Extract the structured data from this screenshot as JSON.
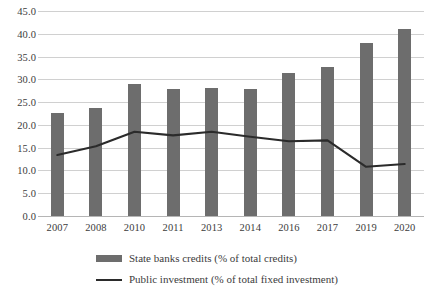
{
  "chart_data": {
    "type": "bar",
    "title": "",
    "subtitle": "",
    "xlabel": "",
    "ylabel": "",
    "categories": [
      "2007",
      "2008",
      "2010",
      "2011",
      "2013",
      "2014",
      "2016",
      "2017",
      "2019",
      "2020"
    ],
    "ylim": [
      0.0,
      45.0
    ],
    "ytick_step": 5.0,
    "ytick_labels": [
      "45.0",
      "40.0",
      "35.0",
      "30.0",
      "25.0",
      "20.0",
      "15.0",
      "10.0",
      "5.0",
      "0.0"
    ],
    "ytick_values": [
      45.0,
      40.0,
      35.0,
      30.0,
      25.0,
      20.0,
      15.0,
      10.0,
      5.0,
      0.0
    ],
    "grid": true,
    "legend_position": "bottom",
    "series": [
      {
        "name": "State banks credits (% of total credits)",
        "type": "bar",
        "color": "#6d6d6d",
        "values": [
          22.6,
          23.8,
          28.9,
          27.9,
          28.1,
          27.9,
          31.3,
          32.8,
          38.0,
          41.0
        ]
      },
      {
        "name": "Public investment (% of total fixed investment)",
        "type": "line",
        "color": "#2b2b2b",
        "values": [
          13.4,
          15.3,
          18.5,
          17.7,
          18.5,
          17.4,
          16.4,
          16.6,
          10.8,
          11.4
        ]
      }
    ]
  },
  "legend": {
    "items": [
      {
        "label": "State banks credits (% of total credits)",
        "marker": "bar-swatch"
      },
      {
        "label": "Public investment (% of total fixed investment)",
        "marker": "line-swatch"
      }
    ]
  }
}
